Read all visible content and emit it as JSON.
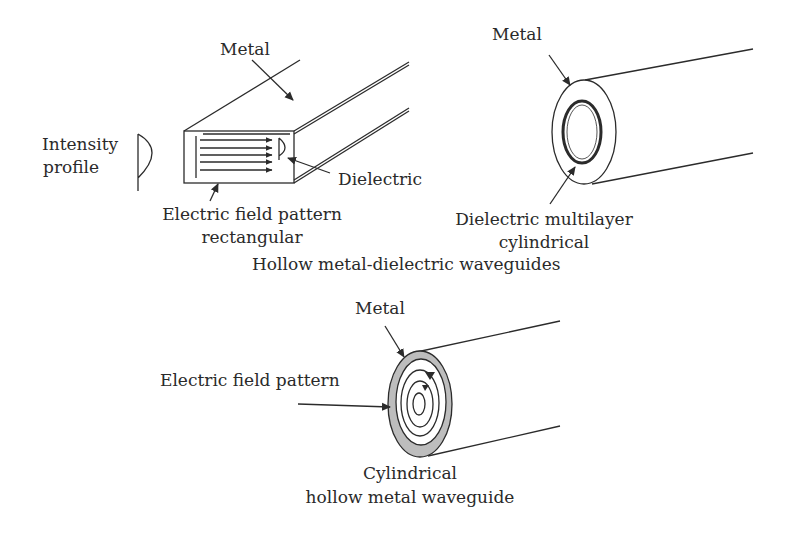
{
  "figure": {
    "title": "Hollow metal-dielectric waveguides",
    "colors": {
      "line": "#2b2b2b",
      "metal_fill": "#bdbdbd",
      "background": "#ffffff"
    },
    "rectangular_waveguide": {
      "label_metal": "Metal",
      "label_intensity_line1": "Intensity",
      "label_intensity_line2": "profile",
      "label_dielectric": "Dielectric",
      "label_field_line1": "Electric field pattern",
      "label_field_line2": "rectangular"
    },
    "multilayer_waveguide": {
      "label_metal": "Metal",
      "label_dielectric_line1": "Dielectric multilayer",
      "label_dielectric_line2": "cylindrical"
    },
    "hollow_metal_waveguide": {
      "label_metal": "Metal",
      "label_field": "Electric field pattern",
      "caption_line1": "Cylindrical",
      "caption_line2": "hollow metal waveguide"
    }
  }
}
